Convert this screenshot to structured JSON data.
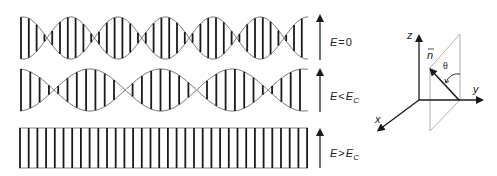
{
  "rows": [
    {
      "label_main": "E",
      "label_op": "=",
      "label_rhs": "0",
      "label_sub": "",
      "state": "helix-short-pitch",
      "pitch_px": 47.4,
      "first_node_x": 47
    },
    {
      "label_main": "E",
      "label_op": "<",
      "label_rhs": "E",
      "label_sub": "C",
      "state": "helix-long-pitch",
      "pitch_px": 71.3,
      "first_node_x": 54
    },
    {
      "label_main": "E",
      "label_op": ">",
      "label_rhs": "E",
      "label_sub": "C",
      "state": "unwound",
      "pitch_px": null,
      "first_node_x": null
    }
  ],
  "field_arrow": {
    "direction": "up",
    "color": "#333333"
  },
  "axes": {
    "x_label": "x",
    "y_label": "y",
    "z_label": "z",
    "normal_label": "ñ",
    "normal_symbol": "n",
    "angle_label": "θ"
  },
  "colors": {
    "line": "#1a1a1a",
    "plane": "#999999",
    "background": "#ffffff"
  }
}
